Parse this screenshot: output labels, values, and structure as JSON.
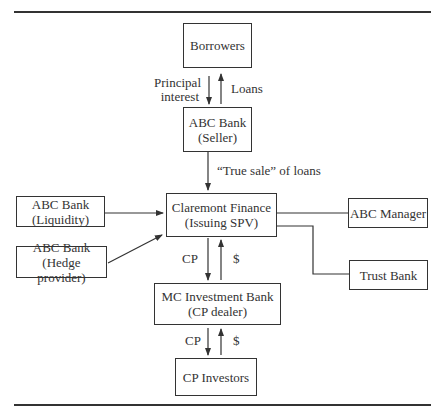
{
  "nodes": {
    "borrowers": {
      "line1": "Borrowers"
    },
    "seller": {
      "line1": "ABC Bank",
      "line2": "(Seller)"
    },
    "spv": {
      "line1": "Claremont Finance",
      "line2": "(Issuing SPV)"
    },
    "liquidity": {
      "line1": "ABC Bank",
      "line2": "(Liquidity)"
    },
    "hedge": {
      "line1": "ABC Bank",
      "line2": "(Hedge provider)"
    },
    "manager": {
      "line1": "ABC Manager"
    },
    "trust": {
      "line1": "Trust Bank"
    },
    "dealer": {
      "line1": "MC Investment Bank",
      "line2": "(CP dealer)"
    },
    "investors": {
      "line1": "CP Investors"
    }
  },
  "edge_labels": {
    "principal_1": "Principal",
    "principal_2": "interest",
    "loans": "Loans",
    "true_sale": "“True sale” of loans",
    "spv_cp": "CP",
    "spv_dollar": "$",
    "dealer_cp": "CP",
    "dealer_dollar": "$"
  }
}
